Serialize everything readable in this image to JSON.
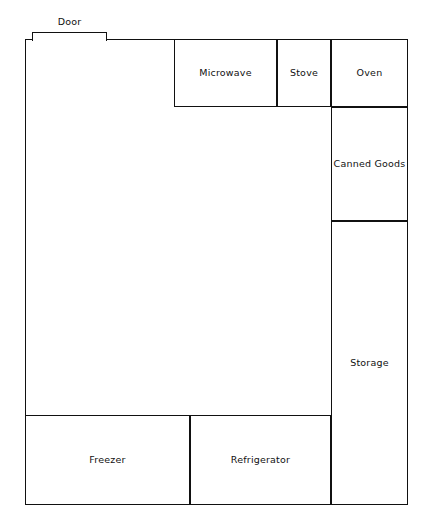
{
  "diagram": {
    "type": "kitchen-floor-plan",
    "line_color": "#111111",
    "background_color": "#ffffff",
    "door": {
      "label": "Door"
    },
    "rooms": [
      {
        "name": "main-room",
        "label": ""
      },
      {
        "name": "microwave",
        "label": "Microwave"
      },
      {
        "name": "stove",
        "label": "Stove"
      },
      {
        "name": "oven",
        "label": "Oven"
      },
      {
        "name": "canned-goods",
        "label": "Canned Goods"
      },
      {
        "name": "storage",
        "label": "Storage"
      },
      {
        "name": "freezer",
        "label": "Freezer"
      },
      {
        "name": "refrigerator",
        "label": "Refrigerator"
      }
    ]
  }
}
